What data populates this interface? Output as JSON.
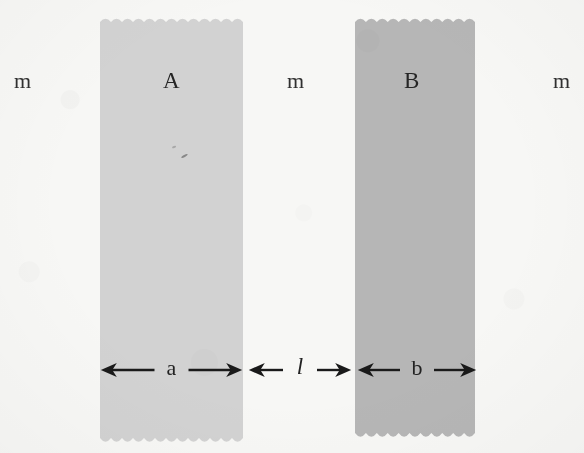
{
  "figure": {
    "kind": "scanned-physics-diagram",
    "background_color": "#f7f7f5"
  },
  "slabs": [
    {
      "id": "A",
      "label": "A",
      "fill_color": "#d2d2d2",
      "label_x": 163,
      "label_y": 69,
      "x": 100,
      "y": 14,
      "width": 143,
      "height": 424
    },
    {
      "id": "B",
      "label": "B",
      "fill_color": "#b6b6b6",
      "label_x": 404,
      "label_y": 69,
      "x": 355,
      "y": 14,
      "width": 120,
      "height": 419
    }
  ],
  "mass_labels": [
    {
      "text": "m",
      "x": 14,
      "y": 70
    },
    {
      "text": "m",
      "x": 287,
      "y": 70
    },
    {
      "text": "m",
      "x": 553,
      "y": 70
    }
  ],
  "dimensions": [
    {
      "name": "a",
      "text": "a",
      "italic": false,
      "x_start": 100,
      "x_end": 243,
      "y": 370,
      "label_x": 163,
      "label_y": 357
    },
    {
      "name": "l",
      "text": "l",
      "italic": true,
      "x_start": 248,
      "x_end": 352,
      "y": 370,
      "label_x": 294,
      "label_y": 355
    },
    {
      "name": "b",
      "text": "b",
      "italic": false,
      "x_start": 357,
      "x_end": 477,
      "y": 370,
      "label_x": 413,
      "label_y": 357
    }
  ],
  "arrow_style": {
    "line_color": "#1a1a1a",
    "line_width": 2.4,
    "head_length": 16,
    "head_half_width": 7
  }
}
